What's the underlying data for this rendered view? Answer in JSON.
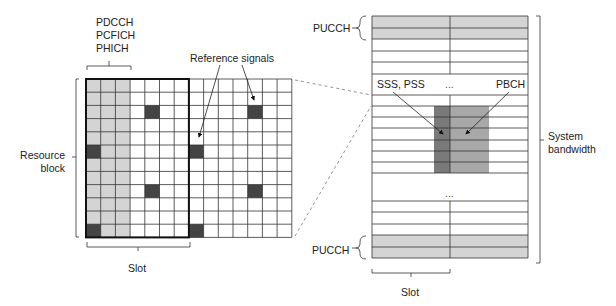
{
  "colors": {
    "grid_line": "#333333",
    "control_region": "#d4d4d4",
    "reference_signal": "#444444",
    "pucch": "#d4d4d4",
    "sss_pss": "#7a7a7a",
    "pbch": "#a8a8a8",
    "dashed": "#888888"
  },
  "left_grid": {
    "x": 86,
    "y": 79,
    "cols": 14,
    "rows": 12,
    "cell_w": 14.7,
    "cell_h": 13.2,
    "control_cols": 3,
    "slot_cols": 7,
    "reference_signals": [
      {
        "col": 0,
        "row": 5
      },
      {
        "col": 0,
        "row": 11
      },
      {
        "col": 4,
        "row": 2
      },
      {
        "col": 4,
        "row": 8
      },
      {
        "col": 7,
        "row": 5
      },
      {
        "col": 7,
        "row": 11
      },
      {
        "col": 11,
        "row": 2
      },
      {
        "col": 11,
        "row": 8
      }
    ]
  },
  "right_grid": {
    "x": 372,
    "width": 156,
    "mid": 450,
    "row_lines_top": [
      16,
      28,
      39,
      51,
      62,
      74
    ],
    "label_gap": [
      74,
      95
    ],
    "row_lines_mid": [
      95,
      106,
      117,
      128,
      140,
      151,
      162,
      173
    ],
    "ellipsis_gap": [
      173,
      201
    ],
    "row_lines_bottom": [
      201,
      212,
      224,
      235,
      247,
      258
    ],
    "pucch_top_rows": [
      [
        16,
        28
      ],
      [
        28,
        39
      ]
    ],
    "pucch_bottom_rows": [
      [
        235,
        247
      ],
      [
        247,
        258
      ]
    ],
    "sss_pss_block": {
      "x": 434,
      "y": 106,
      "w": 16,
      "h": 67
    },
    "pbch_block": {
      "x": 450,
      "y": 106,
      "w": 39,
      "h": 67
    }
  },
  "labels": {
    "control_channels": [
      "PDCCH",
      "PCFICH",
      "PHICH"
    ],
    "reference_signals": "Reference signals",
    "resource_block": [
      "Resource",
      "block"
    ],
    "slot_left": "Slot",
    "pucch_top": "PUCCH",
    "pucch_bottom": "PUCCH",
    "sss_pss": "SSS, PSS",
    "ellipsis_top": "...",
    "pbch": "PBCH",
    "ellipsis_mid": "...",
    "system_bandwidth": [
      "System",
      "bandwidth"
    ],
    "slot_right": "Slot"
  }
}
